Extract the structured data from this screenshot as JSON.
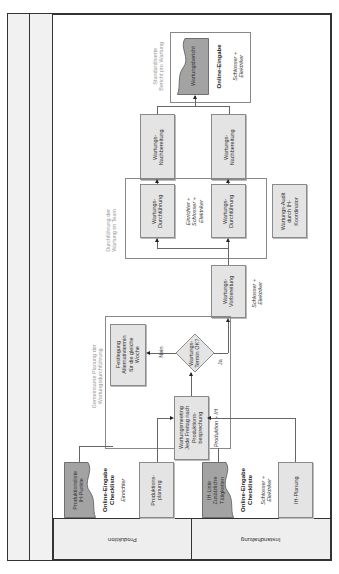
{
  "lanes": {
    "produktion": "Produktion",
    "instandhaltung": "Instandhaltung"
  },
  "groups": {
    "planung_label": "Gemeinsame Planung der\nWartungsdurchführung",
    "durchfuehrung_label": "Durchführung der\nWartung im Team",
    "bericht_label": "Standardisierte\nBericht pro Wartung"
  },
  "inputs": {
    "produktionsliste": "Produktionsliste\nIH-Punkte",
    "produktionsliste_method": "Online-Eingabe\nCheckliste",
    "produktionsliste_role": "Einrichter",
    "produktionsplanung": "Produktions-\nplanung",
    "ih_liste": "IH-Liste\nZusätzliche\nTätigkeiten",
    "ih_liste_method": "Online-Eingabe\nCheckliste",
    "ih_liste_role": "Schlosser +\nElektriker",
    "ih_planung": "IH-Planung"
  },
  "planning": {
    "meeting": "Wartungsmeeting\nJede Freitag nach\nProduktions-\nbesprechung",
    "meeting_role": "Produktion + IH",
    "decision": "Wartungs-\nTermin OK?",
    "no_label": "Nein",
    "yes_label": "Ja",
    "festlegung": "Festlegung\nAlternativtermin\nfür die gleiche\nWoche"
  },
  "execution": {
    "vorbereitung": "Wartungs-\nVorbereitung",
    "vorbereitung_role": "Schlosser +\nElektriker",
    "durchfuehrung_1": "Wartungs-\nDurchführung",
    "durchfuehrung_2": "Wartungs-\nDurchführung",
    "durchfuehrung_role": "Einrichter +\nSchlosser +\nElektriker",
    "audit": "Wartungs-Audit\ndurch IH-\nKoordinator",
    "nachbereitung_1": "Wartungs-\nNachbereitung",
    "nachbereitung_2": "Wartungs-\nNachbereitung"
  },
  "report": {
    "document": "Wartungsbericht",
    "method": "Online-Eingabe",
    "role": "Schlosser +\nElektriker"
  },
  "colors": {
    "box_fill": "#e4e4e4",
    "doc_fill": "#a3a3a3",
    "border": "#8a8a8a",
    "frame": "#333333",
    "label_gray": "#999999"
  }
}
